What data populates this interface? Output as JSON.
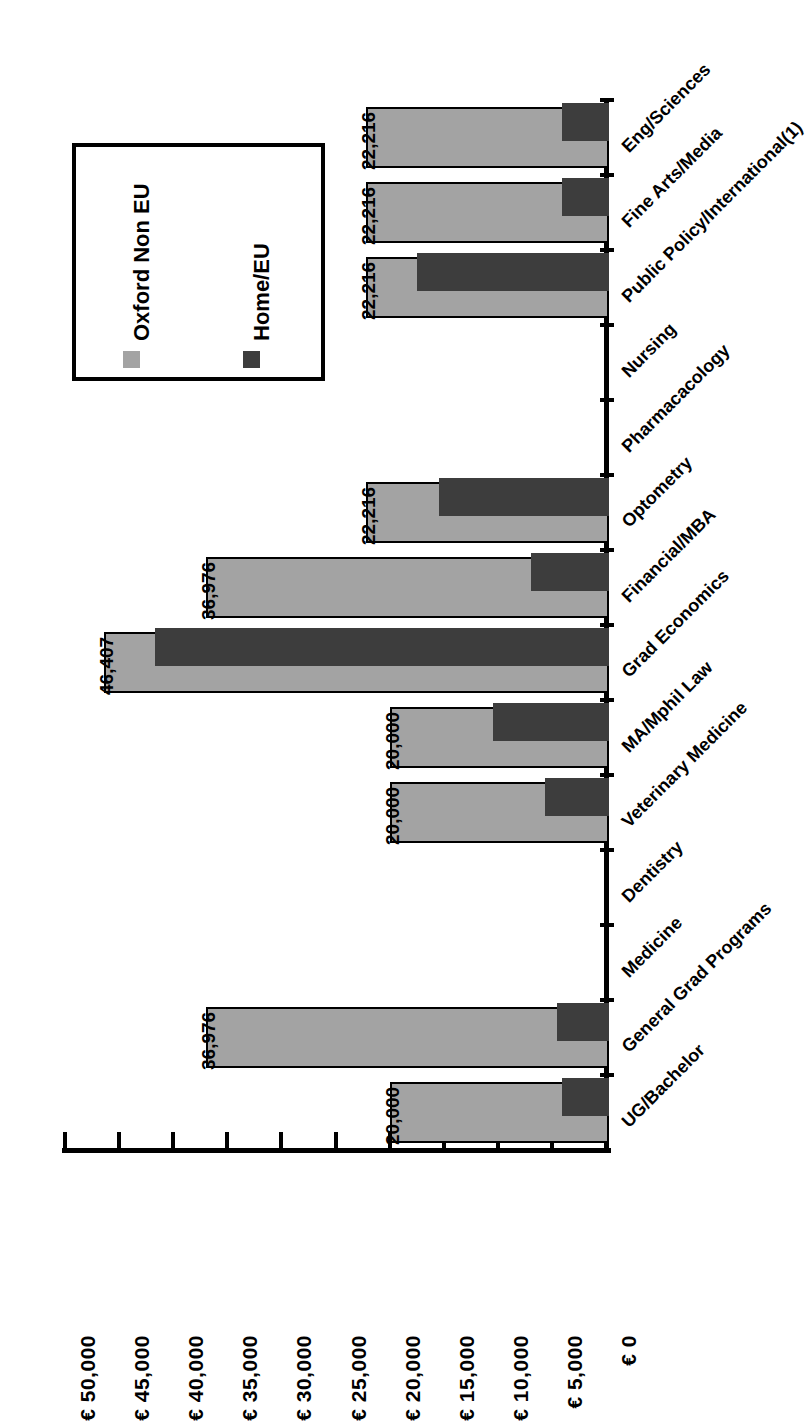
{
  "chart_data": {
    "type": "bar",
    "orientation": "horizontal",
    "title": "",
    "xlabel": "",
    "ylabel": "",
    "grid": false,
    "legend_position": "upper-left",
    "axis": {
      "currency_symbol": "€",
      "ticks": [
        "€ 50,000",
        "€ 45,000",
        "€ 40,000",
        "€ 35,000",
        "€ 30,000",
        "€ 25,000",
        "€ 20,000",
        "€ 15,000",
        "€ 10,000",
        "€ 5,000",
        "€ 0"
      ],
      "tick_values": [
        50000,
        45000,
        40000,
        35000,
        30000,
        25000,
        20000,
        15000,
        10000,
        5000,
        0
      ],
      "range": [
        0,
        50000
      ],
      "step": 5000
    },
    "categories": [
      "Eng/Sciences",
      "Fine Arts/Media",
      "Public Policy/International(1)",
      "Nursing",
      "Pharmacacology",
      "Optometry",
      "Financial/MBA",
      "Grad Economics",
      "MA/Mphil Law",
      "Veterinary Medicine",
      "Dentistry",
      "Medicine",
      "General Grad Programs",
      "UG/Bachelor"
    ],
    "series": [
      {
        "name": "Oxford Non EU",
        "color": "#a3a3a3",
        "values": [
          22216,
          22216,
          22216,
          0,
          0,
          22216,
          36976,
          46407,
          20000,
          20000,
          0,
          0,
          36976,
          20000
        ],
        "labels": [
          "22,216",
          "22,216",
          "22,216",
          "",
          "",
          "22,216",
          "36,976",
          "46,407",
          "20,000",
          "20,000",
          "",
          "",
          "36,976",
          "20,000"
        ]
      },
      {
        "name": "Home/EU",
        "color": "#3d3d3d",
        "values": [
          4100,
          4100,
          17500,
          0,
          0,
          15400,
          6900,
          41700,
          10400,
          5600,
          0,
          0,
          4500,
          4100
        ],
        "labels": [
          "",
          "",
          "",
          "",
          "",
          "",
          "",
          "",
          "",
          "",
          "",
          "",
          "",
          ""
        ]
      }
    ]
  },
  "legend": {
    "entries": [
      {
        "label": "Oxford Non EU",
        "color": "#a3a3a3"
      },
      {
        "label": "Home/EU",
        "color": "#3d3d3d"
      }
    ]
  }
}
